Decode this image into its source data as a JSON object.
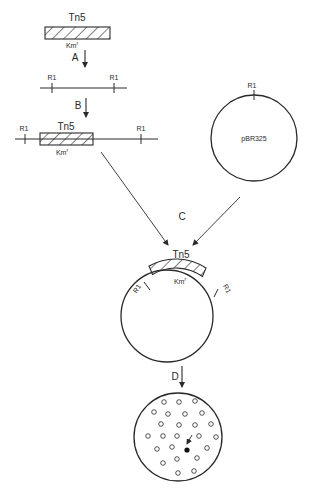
{
  "figure": {
    "steps": [
      {
        "id": "A",
        "label": "A"
      },
      {
        "id": "B",
        "label": "B"
      },
      {
        "id": "C",
        "label": "C"
      },
      {
        "id": "D",
        "label": "D"
      }
    ],
    "transposon": {
      "name": "Tn5",
      "marker": "Km",
      "marker_sup": "r"
    },
    "restriction_site": "R1",
    "plasmid": {
      "name": "pBR325",
      "site_label": "R1"
    },
    "linear_dna_1": {
      "sites": [
        "R1",
        "R1"
      ]
    },
    "linear_dna_2": {
      "insert_label": "Tn5",
      "insert_marker": "Km",
      "insert_marker_sup": "r",
      "sites": [
        "R1",
        "R1"
      ]
    },
    "recombinant_plasmid": {
      "insert_label": "Tn5",
      "insert_marker": "Km",
      "insert_marker_sup": "r",
      "sites": [
        "R1",
        "R1"
      ]
    },
    "plate": {
      "open_colonies": 28,
      "selected_colonies": 1
    }
  },
  "colors": {
    "ink": "#2a2a2a",
    "background": "#ffffff"
  }
}
